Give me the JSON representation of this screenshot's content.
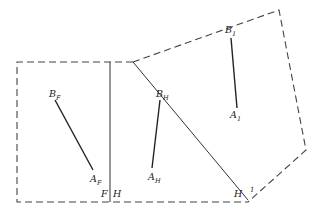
{
  "diagram": {
    "labels": {
      "B_F": {
        "base": "B",
        "sub": "F"
      },
      "A_F": {
        "base": "A",
        "sub": "F"
      },
      "B_H": {
        "base": "B",
        "sub": "H"
      },
      "A_H": {
        "base": "A",
        "sub": "H"
      },
      "B_1": {
        "base": "B",
        "sub": "1"
      },
      "A_1": {
        "base": "A",
        "sub": "1"
      },
      "fold_F": "F",
      "fold_H": "H",
      "corner_H": "H",
      "corner_1": "1"
    },
    "rectangles": [
      {
        "name": "unrotated-frame",
        "style": "dashed",
        "points": [
          [
            17,
            62
          ],
          [
            133,
            62
          ],
          [
            248,
            200
          ],
          [
            17,
            202
          ]
        ]
      },
      {
        "name": "rotated-frame",
        "style": "dashed",
        "points": [
          [
            133,
            62
          ],
          [
            279,
            10
          ],
          [
            306,
            150
          ],
          [
            248,
            200
          ]
        ]
      }
    ],
    "lines": [
      {
        "name": "fold-line-F-H",
        "style": "solid",
        "from": [
          110,
          62
        ],
        "to": [
          110,
          202
        ]
      },
      {
        "name": "hinge-line",
        "style": "solid",
        "from": [
          133,
          62
        ],
        "to": [
          248,
          200
        ]
      },
      {
        "name": "segment-F",
        "style": "bold",
        "from": [
          55,
          100
        ],
        "to": [
          93,
          170
        ]
      },
      {
        "name": "segment-H",
        "style": "bold",
        "from": [
          160,
          100
        ],
        "to": [
          152,
          168
        ]
      },
      {
        "name": "segment-1",
        "style": "bold",
        "from": [
          231,
          38
        ],
        "to": [
          237,
          108
        ]
      }
    ]
  }
}
